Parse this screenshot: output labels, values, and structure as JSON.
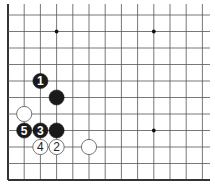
{
  "diagram": {
    "type": "go-board-fragment",
    "visible_columns": 13,
    "visible_rows": 11,
    "edges": [
      "left",
      "bottom"
    ],
    "colors": {
      "background": "#ffffff",
      "line": "#555555",
      "edge": "#333333",
      "black_stone": "#1a1a1a",
      "white_stone": "#ffffff",
      "white_stone_border": "#555555",
      "black_label": "#ffffff",
      "white_label": "#222222"
    },
    "star_points": [
      {
        "col": 3,
        "row": 1
      },
      {
        "col": 9,
        "row": 1
      },
      {
        "col": 9,
        "row": 7
      }
    ],
    "stones": [
      {
        "color": "black",
        "col": 2,
        "row": 4,
        "label": "1"
      },
      {
        "color": "black",
        "col": 3,
        "row": 5,
        "label": ""
      },
      {
        "color": "white",
        "col": 1,
        "row": 6,
        "label": ""
      },
      {
        "color": "black",
        "col": 1,
        "row": 7,
        "label": "5"
      },
      {
        "color": "black",
        "col": 2,
        "row": 7,
        "label": "3"
      },
      {
        "color": "black",
        "col": 3,
        "row": 7,
        "label": ""
      },
      {
        "color": "white",
        "col": 2,
        "row": 8,
        "label": "4"
      },
      {
        "color": "white",
        "col": 3,
        "row": 8,
        "label": "2"
      },
      {
        "color": "white",
        "col": 5,
        "row": 8,
        "label": ""
      }
    ]
  }
}
